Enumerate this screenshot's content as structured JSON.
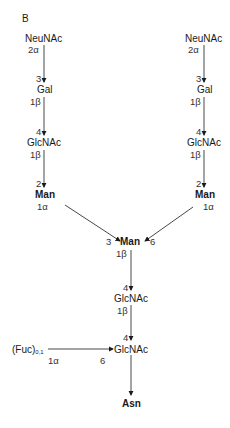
{
  "panel_label": "B",
  "left_branch": {
    "neunac": {
      "name": "NeuNAc",
      "link_from": "2α"
    },
    "gal": {
      "link_to": "3",
      "name": "Gal",
      "link_from": "1β"
    },
    "glcnac": {
      "link_to": "4",
      "name": "GlcNAc",
      "link_from": "1β"
    },
    "man": {
      "link_to": "2",
      "name": "Man",
      "link_from": "1α"
    }
  },
  "right_branch": {
    "neunac": {
      "name": "NeuNAc",
      "link_from": "2α"
    },
    "gal": {
      "link_to": "3",
      "name": "Gal",
      "link_from": "1β"
    },
    "glcnac": {
      "link_to": "4",
      "name": "GlcNAc",
      "link_from": "1β"
    },
    "man": {
      "link_to": "2",
      "name": "Man",
      "link_from": "1α"
    }
  },
  "core": {
    "man": {
      "link_left": "3",
      "name": "Man",
      "link_right": "6",
      "link_from": "1β"
    },
    "glcnac1": {
      "link_to": "4",
      "name": "GlcNAc",
      "link_from": "1β"
    },
    "glcnac2": {
      "link_to": "4",
      "name": "GlcNAc",
      "link_fuc": "6"
    },
    "fucose": {
      "name": "(Fuc)",
      "subscript": "0,1",
      "link_from": "1α"
    },
    "asn": {
      "name": "Asn"
    }
  }
}
